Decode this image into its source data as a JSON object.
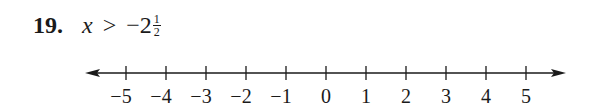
{
  "problem": {
    "number": "19.",
    "variable": "x",
    "operator": ">",
    "whole": "−2",
    "fraction": {
      "numerator": "1",
      "denominator": "2"
    }
  },
  "number_line": {
    "min": -5,
    "max": 5,
    "ticks": [
      "−5",
      "−4",
      "−3",
      "−2",
      "−1",
      "0",
      "1",
      "2",
      "3",
      "4",
      "5"
    ],
    "arrows": [
      "left",
      "right"
    ],
    "color": "#1a1a1a"
  }
}
